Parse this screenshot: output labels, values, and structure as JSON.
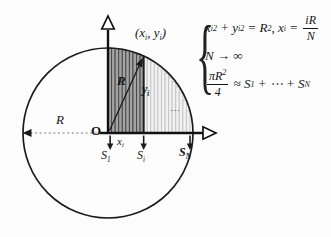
{
  "colors": {
    "ink": "#1c1c1c",
    "axis": "#111111",
    "dashed_line": "#777777",
    "bar_dark_fill": "#a3a3a3",
    "bar_dark_stripe": "#4a4a4a",
    "bar_light_fill": "#f2f2f2",
    "bar_light_stripe": "#c6c6c6",
    "background": "#fdfdfd"
  },
  "diagram": {
    "labels": {
      "point": {
        "p1": "(x",
        "s1": "i",
        "p2": ", y",
        "s2": "i",
        "p3": ")"
      },
      "radius": "R",
      "y_i": {
        "base": "y",
        "sub": "i"
      },
      "horizontal_r": "R",
      "origin": "O",
      "x_i": {
        "base": "x",
        "sub": "i"
      },
      "s_1": {
        "base": "S",
        "sub": "1"
      },
      "s_i": {
        "base": "S",
        "sub": "i"
      },
      "s_n": {
        "base": "S",
        "sub": "N"
      },
      "ellipsis": "⋯"
    }
  },
  "formulas": {
    "brace": "{",
    "line1": {
      "p1": "x",
      "sub1": "i",
      "sup1": "2",
      "p2": " + ",
      "p3": "y",
      "sub2": "i",
      "sup2": "2",
      "p4": " = ",
      "p5": "R",
      "sup3": "2",
      "p6": ", ",
      "p7": "x",
      "sub3": "i",
      "p8": " = ",
      "frac_num": "iR",
      "frac_den": "N"
    },
    "line2": "N → ∞",
    "line3": {
      "frac_num": "πR",
      "frac_num_sup": "2",
      "frac_den": "4",
      "p1": " ≈ S",
      "sub1": "1",
      "p2": " + ⋯ + S",
      "sub2": "N"
    }
  }
}
